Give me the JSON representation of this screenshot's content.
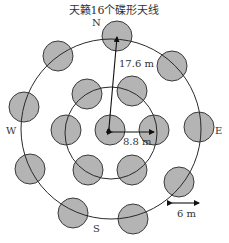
{
  "title": "天籁16个碟形天线",
  "labels": {
    "north": "N",
    "south": "S",
    "east": "E",
    "west": "W",
    "outer_radius": "17.6 m",
    "inner_spacing": "8.8 m",
    "dish_diameter": "6 m"
  },
  "colors": {
    "dish_fill": "#b4b4b4",
    "dish_stroke": "#3a3a3a",
    "ring_stroke": "#2a2a2a"
  },
  "rings": {
    "outer": {
      "cx": 111,
      "cy": 129,
      "r": 90
    },
    "inner": {
      "cx": 111,
      "cy": 133,
      "r": 46
    }
  },
  "dish_radius": 15,
  "dishes_outer": [
    {
      "cx": 117,
      "cy": 36
    },
    {
      "cx": 58,
      "cy": 56
    },
    {
      "cx": 172,
      "cy": 66
    },
    {
      "cx": 24,
      "cy": 107
    },
    {
      "cx": 199,
      "cy": 127
    },
    {
      "cx": 30,
      "cy": 169
    },
    {
      "cx": 179,
      "cy": 182
    },
    {
      "cx": 73,
      "cy": 213
    },
    {
      "cx": 133,
      "cy": 219
    }
  ],
  "dishes_inner": [
    {
      "cx": 87,
      "cy": 94
    },
    {
      "cx": 132,
      "cy": 91
    },
    {
      "cx": 66,
      "cy": 130
    },
    {
      "cx": 110,
      "cy": 130
    },
    {
      "cx": 154,
      "cy": 130
    },
    {
      "cx": 88,
      "cy": 170
    },
    {
      "cx": 132,
      "cy": 170
    }
  ]
}
